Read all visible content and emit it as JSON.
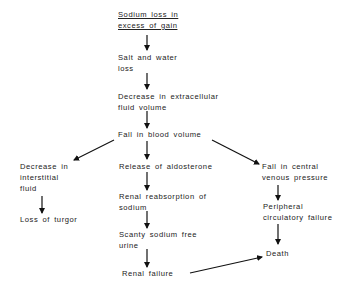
{
  "diagram": {
    "type": "flowchart",
    "nodes": {
      "sodium_loss": {
        "lines": [
          "Sodium loss in",
          "excess of gain"
        ],
        "underlined": true
      },
      "salt_water_loss": {
        "lines": [
          "Salt and water",
          "loss"
        ]
      },
      "decrease_ecf": {
        "lines": [
          "Decrease in extracellular",
          "fluid volume"
        ]
      },
      "fall_blood_volume": {
        "lines": [
          "Fall in blood volume"
        ]
      },
      "decrease_interstitial": {
        "lines": [
          "Decrease in",
          "interstitial",
          "fluid"
        ]
      },
      "loss_turgor": {
        "lines": [
          "Loss of turgor"
        ]
      },
      "release_aldosterone": {
        "lines": [
          "Release of aldosterone"
        ]
      },
      "renal_reabsorption": {
        "lines": [
          "Renal reabsorption of",
          "sodium"
        ]
      },
      "scanty_urine": {
        "lines": [
          "Scanty sodium free",
          "urine"
        ]
      },
      "renal_failure": {
        "lines": [
          "Renal failure"
        ]
      },
      "fall_cvp": {
        "lines": [
          "Fall in central",
          "venous pressure"
        ]
      },
      "peripheral_failure": {
        "lines": [
          "Peripheral",
          "circulatory failure"
        ]
      },
      "death": {
        "lines": [
          "Death"
        ]
      }
    },
    "edges": [
      [
        "sodium_loss",
        "salt_water_loss"
      ],
      [
        "salt_water_loss",
        "decrease_ecf"
      ],
      [
        "decrease_ecf",
        "fall_blood_volume"
      ],
      [
        "fall_blood_volume",
        "decrease_interstitial"
      ],
      [
        "fall_blood_volume",
        "release_aldosterone"
      ],
      [
        "fall_blood_volume",
        "fall_cvp"
      ],
      [
        "decrease_interstitial",
        "loss_turgor"
      ],
      [
        "release_aldosterone",
        "renal_reabsorption"
      ],
      [
        "renal_reabsorption",
        "scanty_urine"
      ],
      [
        "scanty_urine",
        "renal_failure"
      ],
      [
        "fall_cvp",
        "peripheral_failure"
      ],
      [
        "peripheral_failure",
        "death"
      ],
      [
        "renal_failure",
        "death"
      ]
    ],
    "colors": {
      "text": "#222222",
      "line": "#111111",
      "background": "#ffffff"
    }
  }
}
